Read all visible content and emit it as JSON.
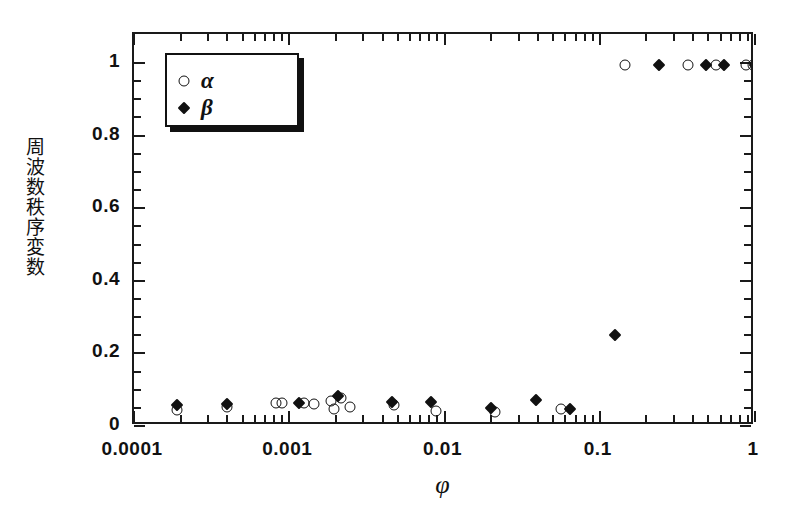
{
  "figure": {
    "background_color": "#ffffff",
    "axis_color": "#111111"
  },
  "legend": {
    "position": "top-left-inside",
    "entries": [
      {
        "label": "α",
        "marker": "open-circle",
        "series": "alpha"
      },
      {
        "label": "β",
        "marker": "filled-diamond",
        "series": "beta"
      }
    ]
  },
  "chart_data": {
    "type": "scatter",
    "title": "",
    "xlabel": "φ",
    "ylabel": "周波数秩序変数",
    "xscale": "log",
    "yscale": "linear",
    "xlim": [
      0.0001,
      1
    ],
    "ylim": [
      0,
      1.08
    ],
    "grid": false,
    "xticks": [
      0.0001,
      0.001,
      0.01,
      0.1,
      1
    ],
    "xtick_labels": [
      "0.0001",
      "0.001",
      "0.01",
      "0.1",
      "1"
    ],
    "yticks": [
      0,
      0.2,
      0.4,
      0.6,
      0.8,
      1
    ],
    "ytick_labels": [
      "0",
      "0.2",
      "0.4",
      "0.6",
      "0.8",
      "1"
    ],
    "yminor_step": 0.05,
    "legend_position": "upper left",
    "series": [
      {
        "name": "α",
        "key": "alpha",
        "marker": "open-circle",
        "color": "#111111",
        "points": [
          [
            0.00019,
            0.044
          ],
          [
            0.0004,
            0.052
          ],
          [
            0.00082,
            0.062
          ],
          [
            0.0009,
            0.062
          ],
          [
            0.00125,
            0.062
          ],
          [
            0.00145,
            0.06
          ],
          [
            0.00185,
            0.068
          ],
          [
            0.00195,
            0.048
          ],
          [
            0.00215,
            0.078
          ],
          [
            0.00245,
            0.052
          ],
          [
            0.0047,
            0.058
          ],
          [
            0.0088,
            0.04
          ],
          [
            0.021,
            0.038
          ],
          [
            0.056,
            0.046
          ],
          [
            0.145,
            0.995
          ],
          [
            0.37,
            0.995
          ],
          [
            0.56,
            0.995
          ],
          [
            0.88,
            0.995
          ],
          [
            0.97,
            0.995
          ]
        ]
      },
      {
        "name": "β",
        "key": "beta",
        "marker": "filled-diamond",
        "color": "#111111",
        "points": [
          [
            0.00019,
            0.058
          ],
          [
            0.0004,
            0.06
          ],
          [
            0.00115,
            0.064
          ],
          [
            0.00205,
            0.082
          ],
          [
            0.0046,
            0.066
          ],
          [
            0.0082,
            0.066
          ],
          [
            0.02,
            0.05
          ],
          [
            0.039,
            0.072
          ],
          [
            0.064,
            0.046
          ],
          [
            0.125,
            0.252
          ],
          [
            0.24,
            0.995
          ],
          [
            0.48,
            0.995
          ],
          [
            0.63,
            0.995
          ],
          [
            1.0,
            0.995
          ]
        ]
      }
    ]
  }
}
